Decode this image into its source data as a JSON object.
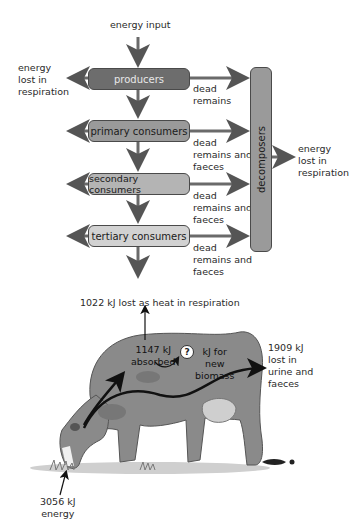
{
  "food_chain": {
    "energy_input": "energy input",
    "energy_lost_left": "energy\nlost in\nrespiration",
    "energy_lost_right": "energy\nlost in\nrespiration",
    "levels": [
      {
        "label": "producers",
        "fill": "#6d6d6d",
        "text_color": "#e8e8e8",
        "side_label": "dead\nremains"
      },
      {
        "label": "primary consumers",
        "fill": "#9a9a9a",
        "text_color": "#1a1a1a",
        "side_label": "dead\nremains and\nfaeces"
      },
      {
        "label": "secondary consumers",
        "fill": "#b4b4b4",
        "text_color": "#1a1a1a",
        "side_label": "dead\nremains and\nfaeces"
      },
      {
        "label": "tertiary consumers",
        "fill": "#d2d2d2",
        "text_color": "#1a1a1a",
        "side_label": "dead\nremains and\nfaeces"
      }
    ],
    "decomposers": {
      "label": "decomposers",
      "fill": "#9a9a9a"
    }
  },
  "cow": {
    "heat_loss": "1022 kJ lost as heat in respiration",
    "absorbed": "1147 kJ\nabsorbed",
    "unknown_symbol": "?",
    "biomass": "kJ for\nnew\nbiomass",
    "urine_faeces": "1909 kJ\nlost in\nurine and\nfaeces",
    "energy_intake": "3056 kJ\nenergy"
  }
}
